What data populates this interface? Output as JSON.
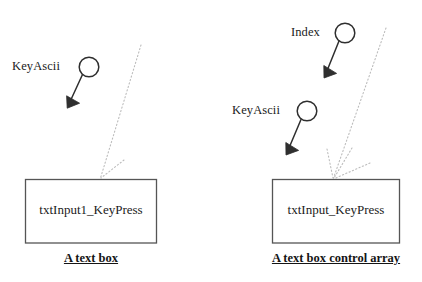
{
  "diagram": {
    "background_color": "#ffffff",
    "line_color": "#3a3a3a",
    "dotted_color": "#b0b0b0",
    "text_color": "#1b1b1b",
    "left_group": {
      "parameters": [
        {
          "label": "KeyAscii",
          "marker": "circle-node",
          "arrow": "arrow-down-left"
        }
      ],
      "box": {
        "text": "txtInput1_KeyPress"
      },
      "caption": "A text box",
      "dotted_rays": 2
    },
    "right_group": {
      "parameters": [
        {
          "label": "Index",
          "marker": "circle-node",
          "arrow": "arrow-down-left"
        },
        {
          "label": "KeyAscii",
          "marker": "circle-node",
          "arrow": "arrow-down-left"
        }
      ],
      "box": {
        "text": "txtInput_KeyPress"
      },
      "caption": "A text box control array",
      "dotted_rays": 3
    }
  }
}
